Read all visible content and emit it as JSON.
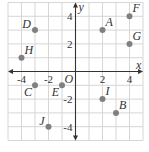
{
  "grid": {
    "x_min": -5,
    "x_max": 5,
    "y_min": -5,
    "y_max": 5,
    "origin_px": [
      75.5,
      71.5
    ],
    "unit_px_x": 13.5,
    "unit_px_y": 13.8,
    "grid_color": "#d6d6d6",
    "axis_color": "#333333",
    "point_color": "#808080"
  },
  "axes": {
    "x_label": "x",
    "y_label": "y",
    "origin_label": "O",
    "x_ticks": [
      {
        "value": -4,
        "label": "-4"
      },
      {
        "value": -2,
        "label": "-2"
      },
      {
        "value": 2,
        "label": "2"
      },
      {
        "value": 4,
        "label": "4"
      }
    ],
    "y_ticks": [
      {
        "value": 4,
        "label": "4"
      },
      {
        "value": 2,
        "label": "2"
      },
      {
        "value": -2,
        "label": "-2"
      },
      {
        "value": -4,
        "label": "-4"
      }
    ]
  },
  "points": [
    {
      "name": "A",
      "x": 2,
      "y": 3
    },
    {
      "name": "B",
      "x": 3,
      "y": -3
    },
    {
      "name": "C",
      "x": -3,
      "y": -1
    },
    {
      "name": "D",
      "x": -3,
      "y": 3
    },
    {
      "name": "E",
      "x": -1,
      "y": -1
    },
    {
      "name": "F",
      "x": 4,
      "y": 4
    },
    {
      "name": "G",
      "x": 4,
      "y": 2
    },
    {
      "name": "H",
      "x": -4,
      "y": 1
    },
    {
      "name": "I",
      "x": 2,
      "y": -2
    },
    {
      "name": "J",
      "x": -2,
      "y": -4
    }
  ]
}
